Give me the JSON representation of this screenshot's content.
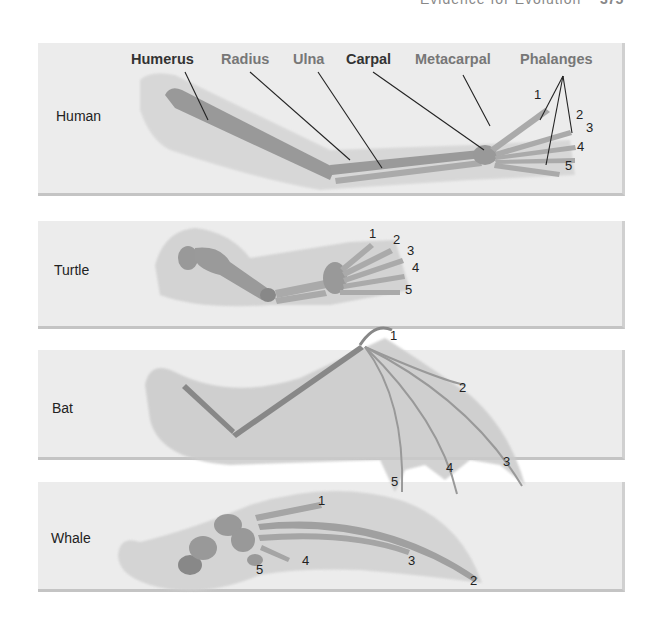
{
  "header": {
    "text": "Evidence for Evolution",
    "page": "375"
  },
  "bone_labels": [
    {
      "label": "Humerus",
      "tone": "dark"
    },
    {
      "label": "Radius",
      "tone": "gray"
    },
    {
      "label": "Ulna",
      "tone": "gray"
    },
    {
      "label": "Carpal",
      "tone": "dark"
    },
    {
      "label": "Metacarpal",
      "tone": "gray"
    },
    {
      "label": "Phalanges",
      "tone": "gray"
    }
  ],
  "panels": [
    {
      "species": "Human",
      "digits": [
        "1",
        "2",
        "3",
        "4",
        "5"
      ]
    },
    {
      "species": "Turtle",
      "digits": [
        "1",
        "2",
        "3",
        "4",
        "5"
      ]
    },
    {
      "species": "Bat",
      "digits": [
        "1",
        "2",
        "3",
        "4",
        "5"
      ]
    },
    {
      "species": "Whale",
      "digits": [
        "1",
        "2",
        "3",
        "4",
        "5"
      ]
    }
  ]
}
